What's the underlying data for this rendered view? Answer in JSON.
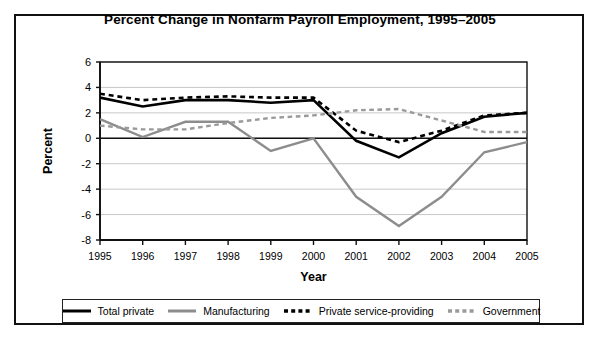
{
  "chart_data": {
    "type": "line",
    "title": "Percent Change in Nonfarm Payroll Employment, 1995–2005",
    "xlabel": "Year",
    "ylabel": "Percent",
    "x": [
      1995,
      1996,
      1997,
      1998,
      1999,
      2000,
      2001,
      2002,
      2003,
      2004,
      2005
    ],
    "categories": [
      "1995",
      "1996",
      "1997",
      "1998",
      "1999",
      "2000",
      "2001",
      "2002",
      "2003",
      "2004",
      "2005"
    ],
    "xlim": [
      1995,
      2005
    ],
    "ylim": [
      -8,
      6
    ],
    "yticks": [
      6,
      4,
      2,
      0,
      -2,
      -4,
      -6,
      -8
    ],
    "ytick_labels": [
      "6",
      "4",
      "2",
      "0",
      "-2",
      "-4",
      "-6",
      "-8"
    ],
    "grid": true,
    "legend_position": "bottom",
    "zero_line": 0,
    "series": [
      {
        "name": "Total private",
        "color": "#000000",
        "style": "solid",
        "width": 2.6,
        "values": [
          3.2,
          2.5,
          3.0,
          3.0,
          2.8,
          3.0,
          -0.2,
          -1.5,
          0.4,
          1.7,
          2.0
        ]
      },
      {
        "name": "Manufacturing",
        "color": "#8d8d8d",
        "style": "solid",
        "width": 2.4,
        "values": [
          1.5,
          0.1,
          1.3,
          1.3,
          -1.0,
          0.0,
          -4.6,
          -6.9,
          -4.6,
          -1.1,
          -0.3
        ]
      },
      {
        "name": "Private service-providing",
        "color": "#000000",
        "style": "dashed",
        "width": 2.6,
        "values": [
          3.5,
          3.0,
          3.2,
          3.3,
          3.2,
          3.2,
          0.6,
          -0.3,
          0.6,
          1.8,
          2.0
        ]
      },
      {
        "name": "Government",
        "color": "#9a9a9a",
        "style": "dashed",
        "width": 2.4,
        "values": [
          1.0,
          0.7,
          0.7,
          1.2,
          1.6,
          1.8,
          2.2,
          2.3,
          1.4,
          0.5,
          0.5
        ]
      }
    ]
  },
  "legend": {
    "items": [
      {
        "label": "Total private"
      },
      {
        "label": "Manufacturing"
      },
      {
        "label": "Private service-providing"
      },
      {
        "label": "Government"
      }
    ]
  }
}
